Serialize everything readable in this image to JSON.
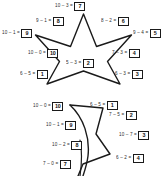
{
  "worksheet": {
    "type": "subtraction-star-puzzle",
    "ink_color": "#1a1a1a",
    "background_color": "#ffffff",
    "puzzles": [
      {
        "id": "top-star",
        "shape": "five-pointed-star",
        "complete": true,
        "labels": [
          {
            "id": "t1",
            "expression": "10 – 3 =",
            "answer": "7"
          },
          {
            "id": "t2",
            "expression": "9 – 1 =",
            "answer": "8"
          },
          {
            "id": "t3",
            "expression": "8 – 2 =",
            "answer": "6"
          },
          {
            "id": "t4",
            "expression": "10 – 1 =",
            "answer": "9"
          },
          {
            "id": "t5",
            "expression": "9 – 4 =",
            "answer": "5"
          },
          {
            "id": "t6",
            "expression": "10 – 0 =",
            "answer": "10"
          },
          {
            "id": "t7",
            "expression": "7 – 3 =",
            "answer": "4"
          },
          {
            "id": "t8",
            "expression": "5 – 3 =",
            "answer": "2"
          },
          {
            "id": "t9",
            "expression": "6 – 5 =",
            "answer": "1"
          },
          {
            "id": "t10",
            "expression": "6 – 3 =",
            "answer": "3"
          }
        ]
      },
      {
        "id": "bottom-star",
        "shape": "five-pointed-star-partial",
        "complete": false,
        "labels": [
          {
            "id": "b1",
            "expression": "10 – 0 =",
            "answer": "10"
          },
          {
            "id": "b2",
            "expression": "6 – 5 =",
            "answer": "1"
          },
          {
            "id": "b3",
            "expression": "10 – 1 =",
            "answer": "9"
          },
          {
            "id": "b4",
            "expression": "7 – 5 =",
            "answer": "2"
          },
          {
            "id": "b5",
            "expression": "10 – 7 =",
            "answer": "3"
          },
          {
            "id": "b6",
            "expression": "10 – 2 =",
            "answer": "8"
          },
          {
            "id": "b7",
            "expression": "7 – 0 =",
            "answer": "7"
          },
          {
            "id": "b8",
            "expression": "6 – 2 =",
            "answer": "4"
          }
        ]
      }
    ]
  }
}
